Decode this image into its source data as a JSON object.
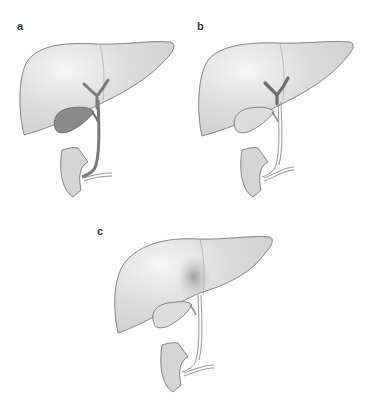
{
  "figure": {
    "panels": [
      {
        "label": "a",
        "gallbladder_state": "filled",
        "gallbladder_fill": "#8a8a8a",
        "intrahepatic_duct_color": "#7a7a7a",
        "lesion": false
      },
      {
        "label": "b",
        "gallbladder_state": "empty",
        "gallbladder_fill": "#dcdcdc",
        "intrahepatic_duct_color": "#6e6e6e",
        "lesion": false
      },
      {
        "label": "c",
        "gallbladder_state": "empty",
        "gallbladder_fill": "#dcdcdc",
        "intrahepatic_duct_color": "#d6d6d6",
        "lesion": true,
        "lesion_color": "#9a9a9a"
      }
    ],
    "colors": {
      "background": "#ffffff",
      "liver_fill": "#dadada",
      "liver_highlight": "#f4f4f4",
      "outline": "#6a6a6a",
      "duodenum_fill": "#d4d4d4"
    }
  }
}
